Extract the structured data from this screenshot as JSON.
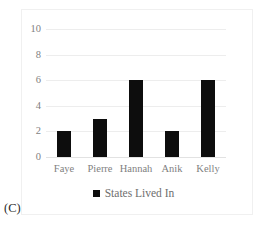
{
  "panel": {
    "caption": "(C)"
  },
  "legend": {
    "position": "bottom-center",
    "marker": "filled-square",
    "entries": [
      {
        "label": "States Lived In",
        "color": "#0d0d0d"
      }
    ]
  },
  "colors": {
    "bar": "#0d0d0d",
    "gridline": "#ededed",
    "axis_text": "#7f7f7f",
    "frame_border": "#f0f0f0",
    "caption_text": "#2b2b2b",
    "background": "#ffffff"
  },
  "chart_data": {
    "type": "bar",
    "title": "",
    "xlabel": "",
    "ylabel": "",
    "categories": [
      "Faye",
      "Pierre",
      "Hannah",
      "Anik",
      "Kelly"
    ],
    "values": [
      2,
      3,
      6,
      2,
      6
    ],
    "series": [
      {
        "name": "States Lived In",
        "values": [
          2,
          3,
          6,
          2,
          6
        ],
        "color": "#0d0d0d"
      }
    ],
    "ylim": [
      0,
      10
    ],
    "yticks": [
      0,
      2,
      4,
      6,
      8,
      10
    ],
    "ytick_labels": [
      "0",
      "2",
      "4",
      "6",
      "8",
      "10"
    ],
    "grid": true,
    "grid_axis": "y",
    "legend_position": "bottom"
  }
}
